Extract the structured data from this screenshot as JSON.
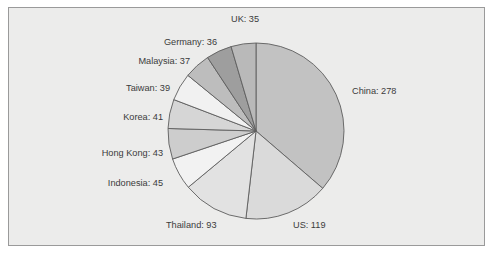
{
  "figure": {
    "background_color": "#ececeb",
    "frame_color": "#9a9a9a",
    "page_color": "#ffffff"
  },
  "chart_data": {
    "type": "pie",
    "title": "",
    "subtitle": "",
    "xlabel": "",
    "ylabel": "",
    "grid": false,
    "legend_position": "none",
    "label_format": "{name}: {value}",
    "start_angle_deg": 90,
    "direction": "clockwise",
    "total": 766,
    "center": {
      "x": 256,
      "y": 131
    },
    "radius": 88,
    "categories": [
      "China",
      "US",
      "Thailand",
      "Indonesia",
      "Hong Kong",
      "Korea",
      "Taiwan",
      "Malaysia",
      "Germany",
      "UK"
    ],
    "values": [
      278,
      119,
      93,
      45,
      43,
      41,
      39,
      37,
      36,
      35
    ],
    "colors": [
      "#c2c2c2",
      "#dadada",
      "#e2e2e2",
      "#f2f2f2",
      "#cdcdcd",
      "#d6d6d6",
      "#f1f1f1",
      "#bdbdbd",
      "#9e9e9e",
      "#b9b9b9"
    ],
    "slices": [
      {
        "name": "China",
        "value": 278,
        "label": "China: 278",
        "color": "#c2c2c2",
        "label_x": 352,
        "label_y": 94,
        "anchor": "start"
      },
      {
        "name": "US",
        "value": 119,
        "label": "US: 119",
        "color": "#dadada",
        "label_x": 293,
        "label_y": 228,
        "anchor": "start"
      },
      {
        "name": "Thailand",
        "value": 93,
        "label": "Thailand: 93",
        "color": "#e2e2e2",
        "label_x": 166,
        "label_y": 228,
        "anchor": "start"
      },
      {
        "name": "Indonesia",
        "value": 45,
        "label": "Indonesia: 45",
        "color": "#f2f2f2",
        "label_x": 163,
        "label_y": 186,
        "anchor": "end"
      },
      {
        "name": "Hong Kong",
        "value": 43,
        "label": "Hong Kong: 43",
        "color": "#cdcdcd",
        "label_x": 163,
        "label_y": 156,
        "anchor": "end"
      },
      {
        "name": "Korea",
        "value": 41,
        "label": "Korea: 41",
        "color": "#d6d6d6",
        "label_x": 163,
        "label_y": 120,
        "anchor": "end"
      },
      {
        "name": "Taiwan",
        "value": 39,
        "label": "Taiwan: 39",
        "color": "#f1f1f1",
        "label_x": 170,
        "label_y": 91,
        "anchor": "end"
      },
      {
        "name": "Malaysia",
        "value": 37,
        "label": "Malaysia: 37",
        "color": "#bdbdbd",
        "label_x": 190,
        "label_y": 64,
        "anchor": "end"
      },
      {
        "name": "Germany",
        "value": 36,
        "label": "Germany: 36",
        "color": "#9e9e9e",
        "label_x": 217,
        "label_y": 45,
        "anchor": "end"
      },
      {
        "name": "UK",
        "value": 35,
        "label": "UK: 35",
        "color": "#b9b9b9",
        "label_x": 231,
        "label_y": 22,
        "anchor": "start"
      }
    ]
  }
}
